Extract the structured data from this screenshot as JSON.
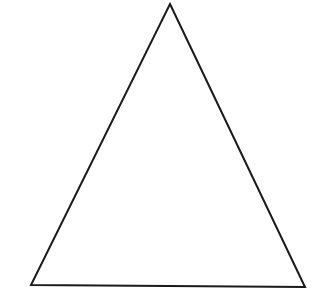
{
  "figure": {
    "shape": "triangle",
    "background": "#ffffff",
    "stroke": "#1a1a1a",
    "stroke_width": 2,
    "fill": "none",
    "vertices": {
      "apex": [
        170,
        4
      ],
      "bottom_left": [
        31,
        285
      ],
      "bottom_right": [
        305,
        287
      ]
    }
  }
}
